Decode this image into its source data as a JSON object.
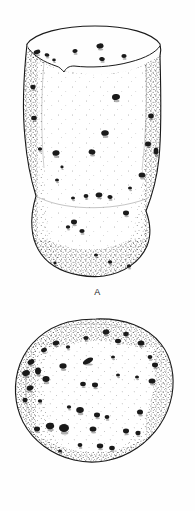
{
  "plate": {
    "background_color": "#fefefe",
    "ink_color": "#1a1a1a",
    "stipple_color": "#262626"
  },
  "figures": [
    {
      "id": "A",
      "caption": "A",
      "view": "lateral-view",
      "description": "Stippled line drawing of a flaring, goblet-shaped bone fragment with numerous dark oval pits across its surface",
      "outline_color": "#1a1a1a",
      "pits": [
        {
          "cx": 37,
          "cy": 52,
          "rx": 3.4,
          "ry": 2.2,
          "rot": -18
        },
        {
          "cx": 47,
          "cy": 55,
          "rx": 2.4,
          "ry": 1.8,
          "rot": 10
        },
        {
          "cx": 54,
          "cy": 60,
          "rx": 1.8,
          "ry": 1.4,
          "rot": 0
        },
        {
          "cx": 75,
          "cy": 51,
          "rx": 2.6,
          "ry": 2.0,
          "rot": -5
        },
        {
          "cx": 100,
          "cy": 46,
          "rx": 3.6,
          "ry": 2.6,
          "rot": -8
        },
        {
          "cx": 102,
          "cy": 59,
          "rx": 2.8,
          "ry": 2.0,
          "rot": 12
        },
        {
          "cx": 124,
          "cy": 56,
          "rx": 2.6,
          "ry": 2.0,
          "rot": 0
        },
        {
          "cx": 33,
          "cy": 87,
          "rx": 2.6,
          "ry": 2.2,
          "rot": 0
        },
        {
          "cx": 116,
          "cy": 97,
          "rx": 4.0,
          "ry": 3.0,
          "rot": -6
        },
        {
          "cx": 151,
          "cy": 116,
          "rx": 2.8,
          "ry": 2.4,
          "rot": 0
        },
        {
          "cx": 34,
          "cy": 118,
          "rx": 2.8,
          "ry": 2.2,
          "rot": 0
        },
        {
          "cx": 105,
          "cy": 133,
          "rx": 3.8,
          "ry": 2.8,
          "rot": -4
        },
        {
          "cx": 148,
          "cy": 144,
          "rx": 3.0,
          "ry": 2.4,
          "rot": 0
        },
        {
          "cx": 92,
          "cy": 152,
          "rx": 3.4,
          "ry": 2.6,
          "rot": 8
        },
        {
          "cx": 56,
          "cy": 153,
          "rx": 3.6,
          "ry": 2.8,
          "rot": -10
        },
        {
          "cx": 40,
          "cy": 149,
          "rx": 2.2,
          "ry": 1.8,
          "rot": 0
        },
        {
          "cx": 156,
          "cy": 151,
          "rx": 2.4,
          "ry": 3.6,
          "rot": 0
        },
        {
          "cx": 142,
          "cy": 175,
          "rx": 3.4,
          "ry": 2.6,
          "rot": 0
        },
        {
          "cx": 130,
          "cy": 188,
          "rx": 2.0,
          "ry": 1.6,
          "rot": 0
        },
        {
          "cx": 86,
          "cy": 196,
          "rx": 2.4,
          "ry": 2.0,
          "rot": 0
        },
        {
          "cx": 99,
          "cy": 195,
          "rx": 3.4,
          "ry": 2.4,
          "rot": -8
        },
        {
          "cx": 110,
          "cy": 197,
          "rx": 2.6,
          "ry": 2.0,
          "rot": 6
        },
        {
          "cx": 73,
          "cy": 198,
          "rx": 2.0,
          "ry": 1.6,
          "rot": 0
        },
        {
          "cx": 126,
          "cy": 213,
          "rx": 3.0,
          "ry": 2.4,
          "rot": 0
        },
        {
          "cx": 74,
          "cy": 222,
          "rx": 3.0,
          "ry": 2.4,
          "rot": 0
        },
        {
          "cx": 68,
          "cy": 227,
          "rx": 2.2,
          "ry": 1.8,
          "rot": 0
        },
        {
          "cx": 82,
          "cy": 231,
          "rx": 2.6,
          "ry": 2.0,
          "rot": 0
        },
        {
          "cx": 57,
          "cy": 180,
          "rx": 2.0,
          "ry": 1.6,
          "rot": 0
        },
        {
          "cx": 62,
          "cy": 167,
          "rx": 1.6,
          "ry": 1.4,
          "rot": 0
        },
        {
          "cx": 96,
          "cy": 255,
          "rx": 2.0,
          "ry": 1.6,
          "rot": 0
        },
        {
          "cx": 110,
          "cy": 262,
          "rx": 2.2,
          "ry": 1.8,
          "rot": 0
        },
        {
          "cx": 129,
          "cy": 266,
          "rx": 2.2,
          "ry": 1.8,
          "rot": 0
        },
        {
          "cx": 55,
          "cy": 263,
          "rx": 1.6,
          "ry": 1.4,
          "rot": 0
        }
      ]
    },
    {
      "id": "B",
      "caption": "B",
      "view": "articular-end-view",
      "description": "Stippled line drawing of a rounded, disc-shaped articular end of the same bone, densely covered with dark pits especially along the left margin",
      "outline_color": "#1a1a1a",
      "pits": [
        {
          "cx": 44,
          "cy": 45,
          "rx": 3.0,
          "ry": 2.2,
          "rot": -20
        },
        {
          "cx": 56,
          "cy": 38,
          "rx": 3.4,
          "ry": 2.4,
          "rot": -15
        },
        {
          "cx": 68,
          "cy": 42,
          "rx": 2.2,
          "ry": 1.8,
          "rot": 0
        },
        {
          "cx": 86,
          "cy": 33,
          "rx": 2.6,
          "ry": 2.0,
          "rot": 0
        },
        {
          "cx": 106,
          "cy": 27,
          "rx": 3.4,
          "ry": 2.6,
          "rot": -10
        },
        {
          "cx": 118,
          "cy": 36,
          "rx": 3.0,
          "ry": 2.2,
          "rot": 0
        },
        {
          "cx": 126,
          "cy": 29,
          "rx": 2.8,
          "ry": 2.2,
          "rot": -12
        },
        {
          "cx": 141,
          "cy": 38,
          "rx": 3.4,
          "ry": 2.6,
          "rot": 0
        },
        {
          "cx": 150,
          "cy": 52,
          "rx": 2.4,
          "ry": 2.0,
          "rot": 0
        },
        {
          "cx": 31,
          "cy": 57,
          "rx": 3.6,
          "ry": 2.6,
          "rot": -25
        },
        {
          "cx": 26,
          "cy": 68,
          "rx": 4.0,
          "ry": 2.8,
          "rot": -20
        },
        {
          "cx": 38,
          "cy": 66,
          "rx": 3.0,
          "ry": 3.4,
          "rot": 0
        },
        {
          "cx": 46,
          "cy": 74,
          "rx": 3.6,
          "ry": 3.0,
          "rot": 0
        },
        {
          "cx": 30,
          "cy": 83,
          "rx": 3.4,
          "ry": 2.6,
          "rot": -15
        },
        {
          "cx": 25,
          "cy": 95,
          "rx": 2.6,
          "ry": 2.2,
          "rot": 0
        },
        {
          "cx": 40,
          "cy": 96,
          "rx": 2.2,
          "ry": 1.8,
          "rot": 0
        },
        {
          "cx": 63,
          "cy": 61,
          "rx": 3.6,
          "ry": 2.8,
          "rot": 0
        },
        {
          "cx": 88,
          "cy": 56,
          "rx": 5.6,
          "ry": 2.6,
          "rot": -28
        },
        {
          "cx": 113,
          "cy": 52,
          "rx": 2.0,
          "ry": 1.6,
          "rot": 0
        },
        {
          "cx": 155,
          "cy": 60,
          "rx": 3.0,
          "ry": 2.4,
          "rot": 0
        },
        {
          "cx": 152,
          "cy": 76,
          "rx": 3.4,
          "ry": 2.6,
          "rot": 0
        },
        {
          "cx": 83,
          "cy": 79,
          "rx": 2.8,
          "ry": 2.2,
          "rot": 0
        },
        {
          "cx": 95,
          "cy": 80,
          "rx": 3.0,
          "ry": 2.4,
          "rot": 0
        },
        {
          "cx": 118,
          "cy": 70,
          "rx": 2.0,
          "ry": 1.6,
          "rot": 0
        },
        {
          "cx": 137,
          "cy": 72,
          "rx": 2.0,
          "ry": 1.6,
          "rot": 0
        },
        {
          "cx": 69,
          "cy": 102,
          "rx": 2.2,
          "ry": 1.8,
          "rot": 0
        },
        {
          "cx": 80,
          "cy": 105,
          "rx": 3.8,
          "ry": 3.0,
          "rot": 0
        },
        {
          "cx": 97,
          "cy": 110,
          "rx": 3.0,
          "ry": 2.4,
          "rot": 0
        },
        {
          "cx": 107,
          "cy": 112,
          "rx": 2.4,
          "ry": 2.0,
          "rot": 0
        },
        {
          "cx": 140,
          "cy": 107,
          "rx": 3.0,
          "ry": 2.6,
          "rot": 0
        },
        {
          "cx": 50,
          "cy": 121,
          "rx": 4.2,
          "ry": 3.2,
          "rot": -12
        },
        {
          "cx": 64,
          "cy": 123,
          "rx": 5.0,
          "ry": 4.0,
          "rot": 0
        },
        {
          "cx": 37,
          "cy": 124,
          "rx": 3.0,
          "ry": 2.4,
          "rot": 0
        },
        {
          "cx": 93,
          "cy": 124,
          "rx": 3.4,
          "ry": 2.6,
          "rot": 0
        },
        {
          "cx": 126,
          "cy": 126,
          "rx": 3.0,
          "ry": 2.4,
          "rot": 0
        },
        {
          "cx": 138,
          "cy": 128,
          "rx": 2.6,
          "ry": 2.2,
          "rot": 0
        },
        {
          "cx": 80,
          "cy": 140,
          "rx": 2.4,
          "ry": 2.0,
          "rot": 0
        },
        {
          "cx": 100,
          "cy": 141,
          "rx": 3.2,
          "ry": 2.4,
          "rot": 0
        },
        {
          "cx": 112,
          "cy": 143,
          "rx": 2.8,
          "ry": 2.2,
          "rot": 0
        },
        {
          "cx": 60,
          "cy": 146,
          "rx": 2.0,
          "ry": 1.6,
          "rot": 0
        }
      ]
    }
  ]
}
